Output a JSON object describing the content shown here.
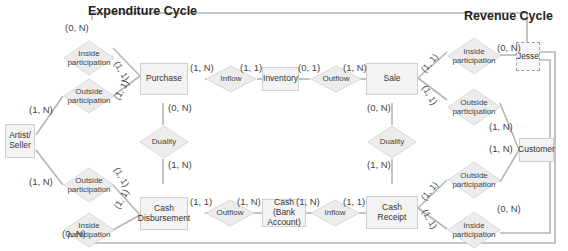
{
  "titles": {
    "expenditure": "Expenditure Cycle",
    "revenue": "Revenue Cycle"
  },
  "entities": {
    "artist_seller": "Artist/ Seller",
    "purchase": "Purchase",
    "inventory": "Inventory",
    "sale": "Sale",
    "jesse": "Jesse",
    "customer": "Customer",
    "cash_disbursement": "Cash Disbursement",
    "cash_bank": "Cash (Bank Account)",
    "cash_receipt": "Cash Receipt"
  },
  "relationships": {
    "exp_inside_top": "Inside participation",
    "exp_outside_top": "Outside participation",
    "exp_outside_bottom": "Outside participation",
    "exp_inside_bottom": "Inside participation",
    "inflow_inventory": "Inflow",
    "outflow_inventory": "Outflow",
    "duality_exp": "Duality",
    "duality_rev": "Duality",
    "outflow_cash": "Outflow",
    "inflow_cash": "Inflow",
    "rev_inside_top": "Inside participation",
    "rev_outside_top": "Outside participation",
    "rev_outside_bottom": "Outside participation",
    "rev_inside_bottom": "Inside participation"
  },
  "cardinalities": {
    "jesse_top_left": "(0, N)",
    "jesse_bottom_left": "(0, N)",
    "artist_top": "(1, N)",
    "artist_bottom": "(1, N)",
    "purchase_inside": "(1, 1)",
    "purchase_outside": "(1, 1)",
    "cd_outside": "(1, 1)",
    "cd_inside": "(1, 1)",
    "purchase_inflow": "(1, N)",
    "inventory_inflow": "(1, 1)",
    "inventory_outflow": "(0, 1)",
    "sale_outflow": "(1, N)",
    "purchase_duality": "(0, N)",
    "cd_duality": "(1, N)",
    "sale_duality": "(0, N)",
    "cr_duality": "(1, N)",
    "cd_outflow": "(1, 1)",
    "cash_outflow": "(1, N)",
    "cash_inflow": "(1, N)",
    "cr_inflow": "(1, 1)",
    "sale_inside": "(1, 1)",
    "sale_outside": "(1, 1)",
    "cr_outside": "(1, 1)",
    "cr_inside": "(1, 1)",
    "jesse_rev_inside": "(0, N)",
    "customer_top": "(1, N)",
    "customer_bottom": "(1, N)",
    "jesse_rev_inside_bottom": "(0, N)"
  },
  "colors": {
    "line": "#b5b5b5",
    "entity_fill": "#f3f3f3",
    "diamond_fill": "#ececec"
  }
}
